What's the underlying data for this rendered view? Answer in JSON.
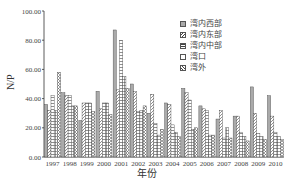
{
  "chart_data": {
    "type": "bar",
    "title": "",
    "xlabel": "年份",
    "ylabel": "N/P",
    "ylim": [
      0,
      100
    ],
    "yticks": [
      "0.00",
      "20.00",
      "40.00",
      "60.00",
      "80.00",
      "100.00"
    ],
    "grid": false,
    "legend_position": "upper right",
    "categories": [
      "1997",
      "1998",
      "1999",
      "2000",
      "2001",
      "2002",
      "2003",
      "2004",
      "2005",
      "2006",
      "2007",
      "2008",
      "2009",
      "2010"
    ],
    "series": [
      {
        "name": "湾内西部",
        "values": [
          36,
          44,
          25,
          45,
          87,
          50,
          30,
          37,
          47,
          35,
          26,
          28,
          48,
          42
        ]
      },
      {
        "name": "湾内东部",
        "values": [
          32,
          42,
          37,
          33,
          46,
          45,
          43,
          36,
          44,
          33,
          32,
          28,
          30,
          28
        ]
      },
      {
        "name": "湾内中部",
        "values": [
          42,
          42,
          37,
          37,
          80,
          31,
          23,
          22,
          39,
          32,
          13,
          17,
          16,
          17
        ]
      },
      {
        "name": "湾口",
        "values": [
          32,
          35,
          37,
          37,
          55,
          32,
          15,
          17,
          19,
          15,
          20,
          14,
          14,
          14
        ]
      },
      {
        "name": "湾外",
        "values": [
          58,
          35,
          31,
          29,
          47,
          35,
          19,
          14,
          20,
          15,
          13,
          11,
          12,
          12
        ]
      }
    ]
  },
  "legend": [
    "湾内西部",
    "湾内东部",
    "湾内中部",
    "湾口",
    "湾外"
  ]
}
